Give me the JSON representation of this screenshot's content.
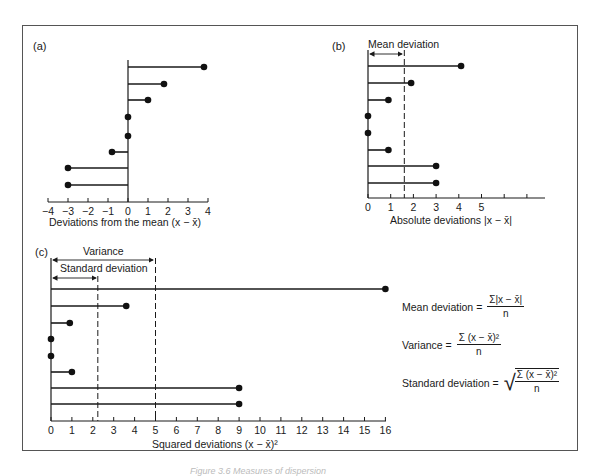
{
  "figure": {
    "caption_partial": "Figure 3.6 Measures of dispersion"
  },
  "panels": {
    "a": {
      "label": "(a)",
      "xlabel": "Deviations from the mean  (x − x̄)",
      "ticks": [
        "−4",
        "−3",
        "−2",
        "−1",
        "0",
        "1",
        "2",
        "3",
        "4"
      ]
    },
    "b": {
      "label": "(b)",
      "annotation": "Mean deviation",
      "xlabel": "Absolute deviations |x − x̄|",
      "ticks": [
        "0",
        "1",
        "2",
        "3",
        "4",
        "5"
      ]
    },
    "c": {
      "label": "(c)",
      "annotation_variance": "Variance",
      "annotation_sd": "Standard deviation",
      "xlabel": "Squared deviations (x − x̄)²",
      "ticks": [
        "0",
        "1",
        "2",
        "3",
        "4",
        "5",
        "6",
        "7",
        "8",
        "9",
        "10",
        "11",
        "12",
        "13",
        "14",
        "15",
        "16"
      ]
    }
  },
  "formulas": {
    "mean_deviation": {
      "lhs": "Mean deviation =",
      "num": "Σ|x − x̄|",
      "den": "n"
    },
    "variance": {
      "lhs": "Variance =",
      "num": "Σ (x − x̄)²",
      "den": "n"
    },
    "standard_deviation": {
      "lhs": "Standard deviation =",
      "num": "Σ (x − x̄)²",
      "den": "n"
    }
  },
  "chart_data": [
    {
      "type": "bar",
      "title": "(a) Deviations from the mean",
      "orientation": "horizontal-lollipop",
      "xlabel": "Deviations from the mean (x − x̄)",
      "xlim": [
        -4,
        4
      ],
      "values": [
        3.8,
        1.8,
        1,
        0,
        0,
        -0.8,
        -3,
        -3
      ]
    },
    {
      "type": "bar",
      "title": "(b) Absolute deviations",
      "orientation": "horizontal-lollipop",
      "xlabel": "Absolute deviations |x − x̄|",
      "xlim": [
        0,
        6
      ],
      "values": [
        4.1,
        1.9,
        0.9,
        0,
        0,
        0.9,
        3,
        3
      ],
      "reference_lines": [
        {
          "name": "Mean deviation",
          "x": 1.6
        }
      ]
    },
    {
      "type": "bar",
      "title": "(c) Squared deviations",
      "orientation": "horizontal-lollipop",
      "xlabel": "Squared deviations (x − x̄)²",
      "xlim": [
        0,
        16
      ],
      "values": [
        16,
        3.6,
        0.9,
        0,
        0,
        1,
        9,
        9
      ],
      "reference_lines": [
        {
          "name": "Standard deviation",
          "x": 2.24
        },
        {
          "name": "Variance",
          "x": 5
        }
      ]
    }
  ]
}
